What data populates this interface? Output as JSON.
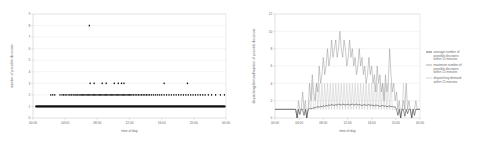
{
  "figure": {
    "background": "#ffffff",
    "grid_color": "#e3e3e3",
    "axis_color": "#b4b4b4"
  },
  "chart_data": [
    {
      "id": "left",
      "type": "scatter",
      "title": "",
      "xlabel": "time of day",
      "ylabel": "number of possible decisions",
      "xticklabels": [
        "00:00",
        "04:00",
        "08:00",
        "12:00",
        "16:00",
        "20:00",
        "00:00"
      ],
      "xtickvalues": [
        0,
        4,
        8,
        12,
        16,
        20,
        24
      ],
      "yticklabels": [
        "0",
        "1",
        "2",
        "3",
        "4",
        "5",
        "6",
        "7",
        "8",
        "9"
      ],
      "ytickvalues": [
        0,
        1,
        2,
        3,
        4,
        5,
        6,
        7,
        8,
        9
      ],
      "xlim": [
        0,
        24
      ],
      "ylim": [
        0,
        9
      ],
      "grid": true,
      "legend": "none",
      "marker_color": "#1a1a1a",
      "series": [
        {
          "name": "possible decisions per event",
          "comment": "y=1 is an almost continuous dense band across the full day; y=2 is a dense but broken band; y=3 sparse; one outlier at y=8",
          "points_y1_band": {
            "y": 1,
            "x_start": 0.35,
            "x_end": 23.9,
            "density": "continuous"
          },
          "points_y2": [
            2.2,
            2.45,
            2.7,
            3.35,
            3.6,
            3.8,
            4.0,
            4.2,
            4.45,
            4.6,
            4.8,
            5.0,
            5.2,
            5.35,
            5.5,
            5.7,
            5.85,
            6.0,
            6.15,
            6.3,
            6.45,
            6.6,
            6.75,
            6.9,
            7.05,
            7.2,
            7.35,
            7.5,
            7.65,
            7.8,
            7.95,
            8.1,
            8.25,
            8.4,
            8.55,
            8.7,
            8.85,
            9.0,
            9.15,
            9.3,
            9.45,
            9.6,
            9.75,
            9.9,
            10.05,
            10.2,
            10.35,
            10.5,
            10.65,
            10.8,
            10.95,
            11.1,
            11.25,
            11.4,
            11.55,
            11.7,
            11.85,
            12.0,
            12.15,
            12.3,
            12.5,
            12.7,
            12.9,
            13.1,
            13.3,
            13.5,
            13.7,
            13.9,
            14.1,
            14.3,
            14.5,
            14.75,
            15.0,
            15.25,
            15.5,
            15.75,
            16.0,
            16.3,
            16.6,
            16.9,
            17.2,
            17.5,
            17.8,
            18.1,
            18.4,
            18.7,
            19.0,
            19.3,
            19.6,
            19.9,
            20.2,
            20.5,
            20.8,
            21.1,
            21.4,
            21.8,
            22.2,
            22.7,
            23.3,
            23.8
          ],
          "points_y3": [
            7.1,
            7.6,
            8.6,
            9.1,
            10.1,
            10.6,
            11.0,
            11.3,
            16.3,
            19.2
          ],
          "points_y8": [
            7.0
          ]
        }
      ]
    },
    {
      "id": "right",
      "type": "line",
      "title": "",
      "xlabel": "time of day",
      "ylabel": "dispatching demand/number of possible decisions",
      "xticklabels": [
        "00:00",
        "04:00",
        "08:00",
        "12:00",
        "16:00",
        "20:00",
        "00:00"
      ],
      "xtickvalues": [
        0,
        4,
        8,
        12,
        16,
        20,
        24
      ],
      "yticklabels": [
        "0",
        "2",
        "4",
        "6",
        "8",
        "10",
        "12"
      ],
      "ytickvalues": [
        0,
        2,
        4,
        6,
        8,
        10,
        12
      ],
      "xlim": [
        0,
        24
      ],
      "ylim": [
        0,
        12
      ],
      "grid": true,
      "legend_position": "right",
      "series": [
        {
          "name": "average number of possible decisions within 15 minutes",
          "color": "#333333",
          "legend_key": "avg",
          "values": [
            1.0,
            1.0,
            1.0,
            1.0,
            1.0,
            1.0,
            1.0,
            1.0,
            1.0,
            1.0,
            1.0,
            1.0,
            1.0,
            1.0,
            1.0,
            1.0,
            0.0,
            1.0,
            0.4,
            1.0,
            1.0,
            0.3,
            1.0,
            0.0,
            1.0,
            1.1,
            1.05,
            1.1,
            1.2,
            1.15,
            1.25,
            1.3,
            1.25,
            1.35,
            1.3,
            1.4,
            1.35,
            1.45,
            1.4,
            1.5,
            1.45,
            1.55,
            1.5,
            1.45,
            1.55,
            1.5,
            1.6,
            1.55,
            1.5,
            1.6,
            1.55,
            1.5,
            1.55,
            1.6,
            1.5,
            1.55,
            1.6,
            1.5,
            1.55,
            1.6,
            1.5,
            1.55,
            1.5,
            1.45,
            1.5,
            1.55,
            1.45,
            1.5,
            1.55,
            1.45,
            1.5,
            1.45,
            1.4,
            1.5,
            1.45,
            1.4,
            1.35,
            1.4,
            1.45,
            1.35,
            1.4,
            1.3,
            1.35,
            1.4,
            1.3,
            1.35,
            1.25,
            1.3,
            1.0,
            0.3,
            1.0,
            0.0,
            1.0,
            1.0,
            0.2,
            1.0,
            0.5,
            1.0,
            1.0,
            0.0,
            1.0,
            0.3,
            1.0,
            1.0,
            1.0,
            1.0
          ]
        },
        {
          "name": "maximum number of possible decisions within 15 minutes",
          "color": "#8a8a8a",
          "legend_key": "max",
          "values": [
            1,
            1,
            1,
            1,
            1,
            1,
            1,
            1,
            1,
            1,
            1,
            1,
            1,
            1,
            1,
            1,
            0,
            2,
            1,
            1,
            3,
            1,
            2,
            0,
            1,
            4,
            2,
            5,
            3,
            2,
            4,
            3,
            6,
            4,
            5,
            7,
            5,
            6,
            8,
            6,
            7,
            9,
            7,
            8,
            9,
            7,
            8,
            10,
            8,
            7,
            9,
            8,
            6,
            7,
            9,
            7,
            8,
            6,
            7,
            5,
            6,
            8,
            6,
            7,
            5,
            6,
            4,
            5,
            7,
            5,
            6,
            4,
            5,
            3,
            6,
            4,
            5,
            3,
            4,
            2,
            5,
            3,
            4,
            8,
            5,
            3,
            4,
            2,
            3,
            1,
            2,
            0,
            1,
            2,
            1,
            4,
            1,
            2,
            1,
            0,
            1,
            1,
            2,
            1,
            1,
            1
          ]
        },
        {
          "name": "dispatching demand within 15 minutes",
          "color": "#c2c2c2",
          "legend_key": "demand",
          "values": [
            1,
            1,
            1,
            1,
            1,
            1,
            1,
            1,
            1,
            1,
            1,
            1,
            1,
            1,
            1,
            1,
            0,
            1,
            1,
            1,
            1,
            1,
            1,
            0,
            1,
            2,
            1,
            4,
            1,
            1,
            4,
            1,
            4,
            1,
            4,
            1,
            4,
            1,
            4,
            1,
            4,
            1,
            4,
            1,
            4,
            1,
            4,
            1,
            4,
            1,
            4,
            1,
            4,
            1,
            4,
            1,
            4,
            1,
            4,
            1,
            4,
            1,
            4,
            1,
            4,
            1,
            4,
            1,
            4,
            1,
            4,
            1,
            4,
            1,
            4,
            1,
            4,
            1,
            4,
            1,
            4,
            1,
            4,
            1,
            4,
            1,
            1,
            1,
            1,
            1,
            1,
            1,
            1,
            4,
            1,
            1,
            1,
            1,
            1,
            1,
            1,
            1,
            1,
            1,
            1,
            1
          ]
        }
      ]
    }
  ]
}
